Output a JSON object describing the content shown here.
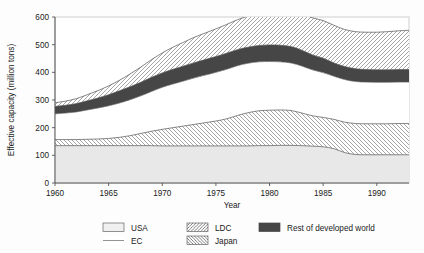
{
  "chart_data": {
    "type": "area",
    "title": "",
    "subtitle": "",
    "xlabel": "Year",
    "ylabel": "Effective capacity (million tons)",
    "xlim": [
      1960,
      1993
    ],
    "ylim": [
      0,
      600
    ],
    "xticks": [
      1960,
      1965,
      1970,
      1975,
      1980,
      1985,
      1990
    ],
    "yticks": [
      0,
      100,
      200,
      300,
      400,
      500,
      600
    ],
    "grid": false,
    "stacked": true,
    "legend_position": "bottom",
    "x": [
      1960,
      1961,
      1962,
      1963,
      1964,
      1965,
      1966,
      1967,
      1968,
      1969,
      1970,
      1971,
      1972,
      1973,
      1974,
      1975,
      1976,
      1977,
      1978,
      1979,
      1980,
      1981,
      1982,
      1983,
      1984,
      1985,
      1986,
      1987,
      1988,
      1989,
      1990,
      1991,
      1992,
      1993
    ],
    "series": [
      {
        "name": "USA",
        "pattern": "solid-light",
        "color": "#e8e8e8",
        "values": [
          135,
          135,
          135,
          135,
          135,
          135,
          135,
          135,
          135,
          135,
          134,
          134,
          134,
          134,
          134,
          134,
          134,
          134,
          134,
          135,
          135,
          136,
          136,
          135,
          133,
          131,
          124,
          110,
          103,
          102,
          102,
          102,
          102,
          102
        ]
      },
      {
        "name": "Japan",
        "pattern": "backslash-hatch",
        "color": "#ffffff",
        "values": [
          22,
          22,
          22,
          23,
          24,
          26,
          30,
          36,
          44,
          52,
          60,
          66,
          72,
          78,
          84,
          90,
          98,
          110,
          120,
          126,
          128,
          128,
          126,
          118,
          110,
          106,
          106,
          110,
          112,
          112,
          112,
          112,
          113,
          113
        ]
      },
      {
        "name": "EC",
        "pattern": "white",
        "color": "#ffffff",
        "values": [
          93,
          96,
          100,
          106,
          112,
          118,
          124,
          130,
          136,
          144,
          152,
          158,
          163,
          168,
          172,
          176,
          179,
          180,
          179,
          177,
          176,
          174,
          172,
          170,
          166,
          162,
          156,
          154,
          152,
          151,
          150,
          150,
          150,
          150
        ]
      },
      {
        "name": "Rest of developed world",
        "pattern": "solid-dark",
        "color": "#464646",
        "values": [
          27,
          28,
          30,
          33,
          36,
          40,
          44,
          47,
          49,
          51,
          52,
          53,
          54,
          55,
          56,
          57,
          58,
          58,
          58,
          59,
          60,
          60,
          59,
          57,
          54,
          52,
          48,
          47,
          46,
          45,
          45,
          45,
          45,
          45
        ]
      },
      {
        "name": "LDC",
        "pattern": "forwardslash-hatch",
        "color": "#ffffff",
        "values": [
          13,
          15,
          18,
          22,
          27,
          32,
          38,
          46,
          55,
          64,
          72,
          80,
          86,
          92,
          96,
          100,
          104,
          108,
          112,
          117,
          122,
          126,
          130,
          132,
          134,
          136,
          136,
          134,
          134,
          135,
          136,
          138,
          140,
          142
        ]
      }
    ],
    "stack_tops": {
      "usa": [
        135,
        135,
        135,
        135,
        135,
        135,
        135,
        135,
        135,
        135,
        134,
        134,
        134,
        134,
        134,
        134,
        134,
        134,
        134,
        135,
        135,
        136,
        136,
        135,
        133,
        131,
        124,
        110,
        103,
        102,
        102,
        102,
        102,
        102
      ],
      "japan": [
        157,
        157,
        157,
        158,
        159,
        161,
        165,
        171,
        179,
        187,
        194,
        200,
        206,
        212,
        218,
        224,
        232,
        244,
        254,
        261,
        263,
        264,
        262,
        253,
        243,
        237,
        230,
        220,
        215,
        214,
        214,
        214,
        215,
        215
      ],
      "ec": [
        250,
        253,
        257,
        264,
        271,
        279,
        289,
        301,
        315,
        331,
        346,
        358,
        369,
        380,
        390,
        400,
        411,
        424,
        433,
        438,
        439,
        438,
        434,
        423,
        409,
        399,
        386,
        374,
        367,
        365,
        364,
        364,
        365,
        365
      ],
      "rest_dev": [
        277,
        281,
        287,
        297,
        307,
        319,
        333,
        348,
        364,
        382,
        398,
        411,
        423,
        435,
        446,
        457,
        469,
        482,
        491,
        497,
        499,
        498,
        493,
        480,
        463,
        451,
        434,
        421,
        413,
        410,
        409,
        409,
        410,
        410
      ],
      "ldc": [
        290,
        296,
        305,
        319,
        334,
        351,
        371,
        394,
        419,
        446,
        470,
        491,
        509,
        527,
        542,
        557,
        573,
        590,
        603,
        614,
        621,
        624,
        623,
        612,
        597,
        587,
        570,
        555,
        547,
        545,
        545,
        547,
        550,
        552
      ]
    },
    "legend": [
      {
        "label": "USA",
        "pattern": "solid-light"
      },
      {
        "label": "EC",
        "pattern": "white"
      },
      {
        "label": "LDC",
        "pattern": "forwardslash-hatch"
      },
      {
        "label": "Japan",
        "pattern": "backslash-hatch"
      },
      {
        "label": "Rest of developed world",
        "pattern": "solid-dark"
      }
    ]
  },
  "axes": {
    "y_label": "Effective capacity (million tons)",
    "x_label": "Year",
    "y_tick_labels": [
      "0",
      "100",
      "200",
      "300",
      "400",
      "500",
      "600"
    ],
    "x_tick_labels": [
      "1960",
      "1965",
      "1970",
      "1975",
      "1980",
      "1985",
      "1990"
    ]
  },
  "legend_items": {
    "usa": "USA",
    "ec": "EC",
    "ldc": "LDC",
    "japan": "Japan",
    "rest": "Rest of developed world"
  },
  "colors": {
    "usa_fill": "#e8e8e8",
    "dark_fill": "#464646",
    "line": "#555555",
    "frame": "#cfcfcf",
    "text": "#1a1a1a"
  }
}
